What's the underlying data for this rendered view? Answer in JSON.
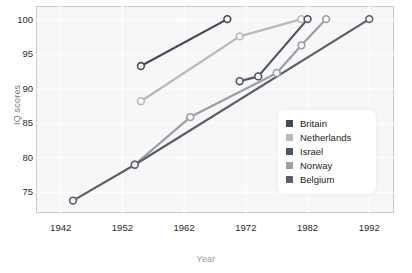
{
  "chart_data": {
    "type": "line",
    "title": "",
    "xlabel": "Year",
    "ylabel": "IQ scores",
    "xlim": [
      1938,
      1996
    ],
    "ylim": [
      72,
      102
    ],
    "xticks": [
      1942,
      1952,
      1962,
      1972,
      1982,
      1992
    ],
    "yticks": [
      75,
      80,
      85,
      90,
      95,
      100
    ],
    "grid": true,
    "legend_position": "center-right",
    "series": [
      {
        "name": "Britain",
        "color": "#3f4a5a",
        "points": [
          {
            "x": 1955,
            "y": 93.3
          },
          {
            "x": 1969,
            "y": 100.1
          }
        ]
      },
      {
        "name": "Netherlands",
        "color": "#b9b9b9",
        "points": [
          {
            "x": 1955,
            "y": 88.2
          },
          {
            "x": 1971,
            "y": 97.6
          },
          {
            "x": 1981,
            "y": 100.1
          }
        ]
      },
      {
        "name": "Israel",
        "color": "#4b5563",
        "points": [
          {
            "x": 1971,
            "y": 91.1
          },
          {
            "x": 1974,
            "y": 91.8
          },
          {
            "x": 1982,
            "y": 100.1
          }
        ]
      },
      {
        "name": "Norway",
        "color": "#9aa0a6",
        "points": [
          {
            "x": 1954,
            "y": 79.0
          },
          {
            "x": 1963,
            "y": 85.9
          },
          {
            "x": 1977,
            "y": 92.3
          },
          {
            "x": 1981,
            "y": 96.3
          },
          {
            "x": 1985,
            "y": 100.1
          }
        ]
      },
      {
        "name": "Belgium",
        "color": "#59606b",
        "points": [
          {
            "x": 1944,
            "y": 73.8
          },
          {
            "x": 1954,
            "y": 79.0
          },
          {
            "x": 1992,
            "y": 100.1
          }
        ]
      }
    ]
  },
  "legend": {
    "items": [
      {
        "label": "Britain",
        "color": "#3f4a5a"
      },
      {
        "label": "Netherlands",
        "color": "#b9b9b9"
      },
      {
        "label": "Israel",
        "color": "#4b5563"
      },
      {
        "label": "Norway",
        "color": "#9aa0a6"
      },
      {
        "label": "Belgium",
        "color": "#59606b"
      }
    ]
  },
  "axes": {
    "y_title": "IQ scores",
    "x_title": "Year",
    "y_tick_labels": [
      "100",
      "95",
      "90",
      "85",
      "80",
      "75"
    ],
    "x_tick_labels": [
      "1942",
      "1952",
      "1962",
      "1972",
      "1982",
      "1992"
    ]
  }
}
